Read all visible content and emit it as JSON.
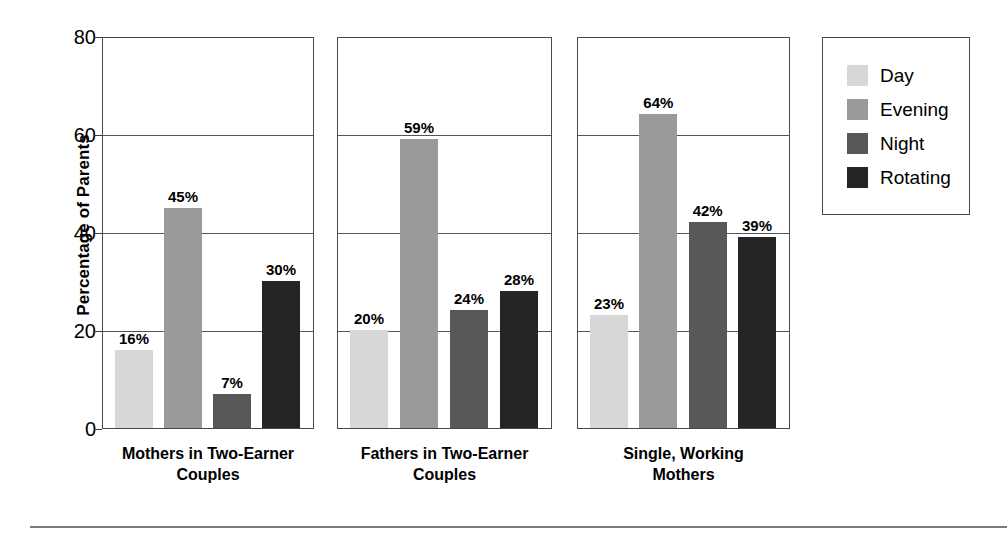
{
  "chart_data": {
    "type": "bar",
    "title": "",
    "subtitle": "",
    "xlabel": "",
    "ylabel": "Percentage of Parents",
    "ylim": [
      0,
      80
    ],
    "yticks": [
      0,
      20,
      40,
      60,
      80
    ],
    "ytick_labels": [
      "0",
      "20",
      "40",
      "60",
      "80"
    ],
    "grid": true,
    "grid_axis": "y",
    "legend_position": "right",
    "panel_layout": "three separate panels, one per category",
    "value_label_suffix": "%",
    "categories": [
      "Mothers in Two-Earner Couples",
      "Fathers in Two-Earner Couples",
      "Single, Working Mothers"
    ],
    "category_lines": [
      [
        "Mothers in Two-Earner",
        "Couples"
      ],
      [
        "Fathers in Two-Earner",
        "Couples"
      ],
      [
        "Single, Working",
        "Mothers"
      ]
    ],
    "series": [
      {
        "name": "Day",
        "color": "#d7d7d7",
        "values": [
          16,
          20,
          23
        ]
      },
      {
        "name": "Evening",
        "color": "#9a9a9a",
        "values": [
          45,
          59,
          64
        ]
      },
      {
        "name": "Night",
        "color": "#585858",
        "values": [
          7,
          24,
          42
        ]
      },
      {
        "name": "Rotating",
        "color": "#252525",
        "values": [
          30,
          28,
          39
        ]
      }
    ],
    "data_labels": [
      [
        "16%",
        "45%",
        "7%",
        "30%"
      ],
      [
        "20%",
        "59%",
        "24%",
        "28%"
      ],
      [
        "23%",
        "64%",
        "42%",
        "39%"
      ]
    ]
  },
  "legend": {
    "items": [
      {
        "label": "Day",
        "color": "#d7d7d7"
      },
      {
        "label": "Evening",
        "color": "#9a9a9a"
      },
      {
        "label": "Night",
        "color": "#585858"
      },
      {
        "label": "Rotating",
        "color": "#252525"
      }
    ]
  },
  "axis": {
    "y_title": "Percentage of Parents",
    "y_tick_0": "0",
    "y_tick_1": "20",
    "y_tick_2": "40",
    "y_tick_3": "60",
    "y_tick_4": "80"
  },
  "panels": [
    {
      "label_line1": "Mothers in Two-Earner",
      "label_line2": "Couples",
      "values": [
        16,
        45,
        7,
        30
      ],
      "labels": [
        "16%",
        "45%",
        "7%",
        "30%"
      ]
    },
    {
      "label_line1": "Fathers in Two-Earner",
      "label_line2": "Couples",
      "values": [
        20,
        59,
        24,
        28
      ],
      "labels": [
        "20%",
        "59%",
        "24%",
        "28%"
      ]
    },
    {
      "label_line1": "Single, Working",
      "label_line2": "Mothers",
      "values": [
        23,
        64,
        42,
        39
      ],
      "labels": [
        "23%",
        "64%",
        "42%",
        "39%"
      ]
    }
  ]
}
